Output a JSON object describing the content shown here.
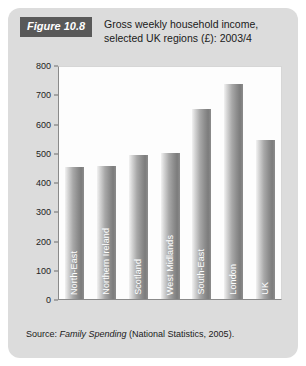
{
  "figure": {
    "badge": "Figure 10.8",
    "title_line1": "Gross weekly household income,",
    "title_line2": "selected UK regions (£): 2003/4",
    "source_prefix": "Source: ",
    "source_publication": "Family Spending",
    "source_suffix": " (National Statistics, 2005)."
  },
  "colors": {
    "card_background": "#dcdcdc",
    "badge_background": "#595959",
    "plot_background": "#fdfdfd",
    "axis_line": "#8a8a8a",
    "bar_dark": "#7c7c7c",
    "bar_light": "#f2f2f2",
    "text": "#1a1a1a"
  },
  "chart_data": {
    "type": "bar",
    "title": "Gross weekly household income, selected UK regions (£): 2003/4",
    "xlabel": "",
    "ylabel": "",
    "ylim": [
      0,
      800
    ],
    "yticks": [
      0,
      100,
      200,
      300,
      400,
      500,
      600,
      700,
      800
    ],
    "ytick_labels": [
      "0",
      "100",
      "200",
      "300",
      "400",
      "500",
      "600",
      "700",
      "800"
    ],
    "grid": false,
    "legend": false,
    "label_position": "inside-bar-rotated",
    "categories": [
      "North-East",
      "Northern Ireland",
      "Scotland",
      "West Midlands",
      "South-East",
      "London",
      "UK"
    ],
    "values": [
      455,
      458,
      498,
      502,
      655,
      740,
      550
    ],
    "units": "£ per week"
  }
}
